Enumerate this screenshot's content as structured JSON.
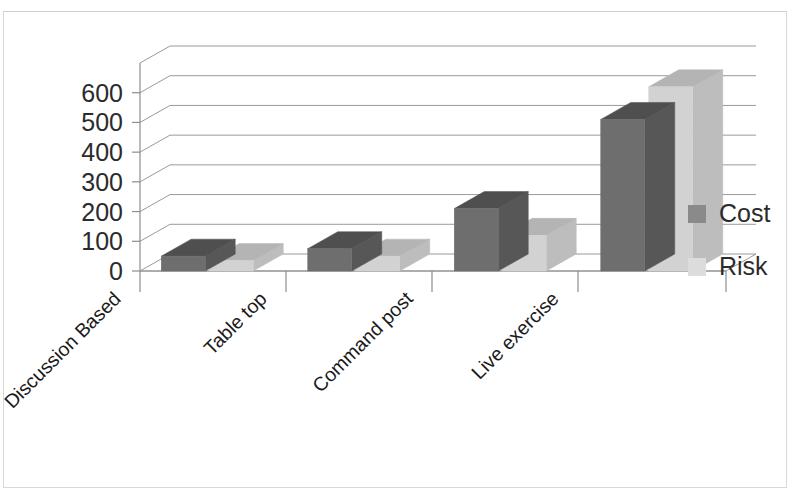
{
  "chart_data": {
    "type": "bar",
    "title": "",
    "subtitle": "",
    "xlabel": "",
    "ylabel": "",
    "categories": [
      "Discussion Based",
      "Table top",
      "Command post",
      "Live exercise"
    ],
    "series": [
      {
        "name": "Cost",
        "values": [
          50,
          75,
          210,
          510
        ],
        "color": "#6e6e6e"
      },
      {
        "name": "Risk",
        "values": [
          35,
          50,
          120,
          620
        ],
        "color": "#d2d2d2"
      }
    ],
    "yticks": [
      0,
      100,
      200,
      300,
      400,
      500,
      600
    ],
    "ylim": [
      0,
      700
    ],
    "grid": true,
    "legend_position": "right",
    "style": "3d-clustered-column"
  },
  "axis": {
    "y_tick_labels": [
      "600",
      "500",
      "400",
      "300",
      "200",
      "100",
      "0"
    ]
  },
  "legend": {
    "items": [
      {
        "label": "Cost",
        "swatch_color": "#8a8a8a"
      },
      {
        "label": "Risk",
        "swatch_color": "#dcdcdc"
      }
    ]
  },
  "colors": {
    "cost_front": "#6e6e6e",
    "cost_top": "#4f4f4f",
    "cost_side": "#575757",
    "risk_front": "#d2d2d2",
    "risk_top": "#b4b4b4",
    "risk_side": "#bdbdbd",
    "gridline": "#9a9a9a",
    "axis": "#8d8d8d",
    "text": "#1f1f1f",
    "background": "#ffffff",
    "frame": "#d8d8d8"
  }
}
